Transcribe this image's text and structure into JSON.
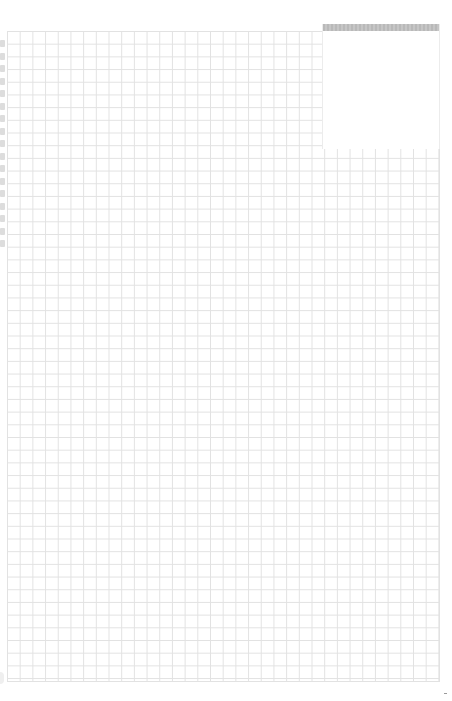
{
  "page": {
    "type": "graph-paper-notebook-page",
    "grid": {
      "cell_size_px": 12.7,
      "line_color": "#e2e2e2",
      "background": "#ffffff"
    },
    "note_box": {
      "bar_color": "#bfbfbf",
      "text": ""
    },
    "binding": {
      "hole_count": 17,
      "hole_color": "#d4d4d4"
    }
  }
}
